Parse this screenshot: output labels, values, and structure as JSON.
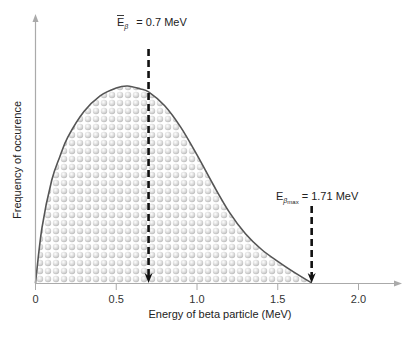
{
  "chart_data": {
    "type": "area",
    "title": "",
    "xlabel": "Energy of beta particle (MeV)",
    "ylabel": "Frequency of occurence",
    "xlim": [
      0,
      2.25
    ],
    "ylim": [
      0,
      1.0
    ],
    "x_ticks": [
      0,
      0.5,
      1.0,
      1.5,
      2.0
    ],
    "x_tick_labels": [
      "0",
      "0.5",
      "1.0",
      "1.5",
      "2.0"
    ],
    "y_ticks": [],
    "grid": false,
    "legend": "none",
    "series": [
      {
        "name": "Beta energy spectrum",
        "x": [
          0,
          0.04,
          0.1,
          0.15,
          0.2,
          0.3,
          0.4,
          0.5,
          0.57,
          0.65,
          0.7,
          0.8,
          0.9,
          1.0,
          1.1,
          1.2,
          1.3,
          1.4,
          1.5,
          1.6,
          1.71
        ],
        "y": [
          0,
          0.28,
          0.52,
          0.64,
          0.74,
          0.87,
          0.95,
          0.99,
          1.0,
          0.985,
          0.97,
          0.9,
          0.79,
          0.65,
          0.5,
          0.36,
          0.25,
          0.17,
          0.11,
          0.055,
          0
        ]
      }
    ],
    "annotations": [
      {
        "name": "mean-energy",
        "x": 0.7,
        "label_main": "E",
        "label_sub": "β",
        "label_bar": true,
        "label_value": "= 0.7 MeV"
      },
      {
        "name": "max-energy",
        "x": 1.71,
        "label_main": "E",
        "label_sub": "β",
        "label_sub2": "max",
        "label_value": "= 1.71 MeV"
      }
    ]
  },
  "text": {
    "mean_main": "E",
    "mean_sub": "β",
    "mean_value": "= 0.7 MeV",
    "max_main": "E",
    "max_sub": "β",
    "max_sub2": "max",
    "max_value": "= 1.71 MeV"
  }
}
